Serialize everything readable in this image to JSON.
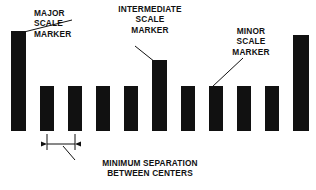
{
  "figure": {
    "background_color": "#ffffff",
    "ink_color": "#111111"
  },
  "labels": {
    "major": {
      "lines": [
        "MAJOR",
        "SCALE",
        "MARKER"
      ],
      "align": "left"
    },
    "intermediate": {
      "lines": [
        "INTERMEDIATE",
        "SCALE",
        "MARKER"
      ],
      "align": "center"
    },
    "minor": {
      "lines": [
        "MINOR",
        "SCALE",
        "MARKER"
      ],
      "align": "center"
    },
    "minimum_separation": {
      "lines": [
        "MINIMUM SEPARATION",
        "BETWEEN CENTERS"
      ],
      "align": "center"
    }
  },
  "markers": [
    {
      "index": 0,
      "kind": "major",
      "x": 11,
      "top": 31,
      "width": 15,
      "bottom": 131
    },
    {
      "index": 1,
      "kind": "minor",
      "x": 40,
      "top": 86,
      "width": 14,
      "bottom": 131
    },
    {
      "index": 2,
      "kind": "minor",
      "x": 68,
      "top": 86,
      "width": 14,
      "bottom": 131
    },
    {
      "index": 3,
      "kind": "minor",
      "x": 96,
      "top": 86,
      "width": 14,
      "bottom": 131
    },
    {
      "index": 4,
      "kind": "minor",
      "x": 124,
      "top": 86,
      "width": 14,
      "bottom": 131
    },
    {
      "index": 5,
      "kind": "intermediate",
      "x": 152,
      "top": 60,
      "width": 15,
      "bottom": 131
    },
    {
      "index": 6,
      "kind": "minor",
      "x": 181,
      "top": 86,
      "width": 14,
      "bottom": 131
    },
    {
      "index": 7,
      "kind": "minor",
      "x": 209,
      "top": 86,
      "width": 14,
      "bottom": 131
    },
    {
      "index": 8,
      "kind": "minor",
      "x": 237,
      "top": 86,
      "width": 14,
      "bottom": 131
    },
    {
      "index": 9,
      "kind": "minor",
      "x": 265,
      "top": 86,
      "width": 14,
      "bottom": 131
    },
    {
      "index": 10,
      "kind": "major",
      "x": 293,
      "top": 35,
      "width": 16,
      "bottom": 131
    }
  ],
  "dimension": {
    "label": "MINIMUM SEPARATION BETWEEN CENTERS",
    "from_marker_index": 1,
    "to_marker_index": 2,
    "line_y": 144,
    "x_start": 47,
    "x_end": 75,
    "extension_top": 134,
    "extension_bottom": 150
  },
  "leaders": [
    {
      "name": "major-leader",
      "x1": 72,
      "y1": 20,
      "x2": 20,
      "y2": 33
    },
    {
      "name": "intermediate-leader",
      "x1": 135,
      "y1": 46,
      "x2": 155,
      "y2": 62
    },
    {
      "name": "minor-leader",
      "x1": 243,
      "y1": 58,
      "x2": 212,
      "y2": 87
    },
    {
      "name": "dimension-leader",
      "x1": 75,
      "y1": 160,
      "x2": 63,
      "y2": 146
    }
  ]
}
